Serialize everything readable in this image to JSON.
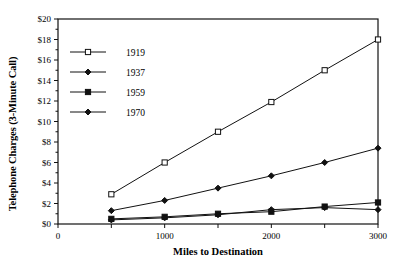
{
  "chart_data": {
    "type": "line",
    "title": "",
    "xlabel": "Miles to Destination",
    "ylabel": "Telephone Charges (3-Minute Call)",
    "x": [
      500,
      1000,
      1500,
      2000,
      2500,
      3000
    ],
    "xlim": [
      0,
      3000
    ],
    "ylim": [
      0,
      20
    ],
    "xticks": [
      0,
      500,
      1000,
      1500,
      2000,
      2500,
      3000
    ],
    "xtick_labels": [
      "0",
      "",
      "1000",
      "",
      "2000",
      "",
      "3000"
    ],
    "yticks": [
      0,
      2,
      4,
      6,
      8,
      10,
      12,
      14,
      16,
      18,
      20
    ],
    "ytick_labels": [
      "$0",
      "$2",
      "$4",
      "$6",
      "$8",
      "$10",
      "$12",
      "$14",
      "$16",
      "$18",
      "$20"
    ],
    "grid": false,
    "legend_position": "upper-left-inside",
    "series": [
      {
        "name": "1919",
        "marker": "open-square",
        "values": [
          2.9,
          6.0,
          9.0,
          11.9,
          15.0,
          18.0
        ]
      },
      {
        "name": "1937",
        "marker": "diamond",
        "values": [
          1.3,
          2.3,
          3.5,
          4.7,
          6.0,
          7.4
        ]
      },
      {
        "name": "1959",
        "marker": "filled-square",
        "values": [
          0.5,
          0.7,
          1.0,
          1.2,
          1.7,
          2.1
        ]
      },
      {
        "name": "1970",
        "marker": "diamond",
        "values": [
          0.4,
          0.6,
          0.9,
          1.4,
          1.6,
          1.4
        ]
      }
    ]
  },
  "axes": {
    "y_title": "Telephone Charges (3-Minute Call)",
    "x_title": "Miles to Destination"
  },
  "legend": {
    "entries": [
      {
        "label": "1919"
      },
      {
        "label": "1937"
      },
      {
        "label": "1959"
      },
      {
        "label": "1970"
      }
    ]
  }
}
